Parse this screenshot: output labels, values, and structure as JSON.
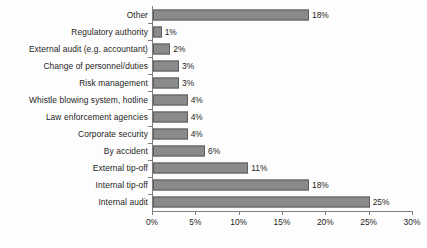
{
  "chart_data": {
    "type": "bar",
    "orientation": "horizontal",
    "title": "",
    "xlabel": "",
    "ylabel": "",
    "xlim": [
      0,
      30
    ],
    "grid": false,
    "legend": null,
    "value_suffix": "%",
    "categories": [
      "Other",
      "Regulatory authority",
      "External audit (e.g. accountant)",
      "Change of personnel/duties",
      "Risk management",
      "Whistle blowing system, hotline",
      "Law enforcement agencies",
      "Corporate security",
      "By accident",
      "External tip-off",
      "Internal tip-off",
      "Internal audit"
    ],
    "values": [
      18,
      1,
      2,
      3,
      3,
      4,
      4,
      4,
      6,
      11,
      18,
      25
    ],
    "value_labels": [
      "18%",
      "1%",
      "2%",
      "3%",
      "3%",
      "4%",
      "4%",
      "4%",
      "6%",
      "11%",
      "18%",
      "25%"
    ],
    "xticks": [
      0,
      5,
      10,
      15,
      20,
      25,
      30
    ],
    "xtick_labels": [
      "0%",
      "5%",
      "10%",
      "15%",
      "20%",
      "25%",
      "30%"
    ],
    "colors": {
      "bar_fill": "#8a8a8a",
      "bar_border": "#5d5d5d",
      "axis": "#7d7d7d",
      "text": "#1d1d1d",
      "background": "#fdfdfd"
    }
  }
}
